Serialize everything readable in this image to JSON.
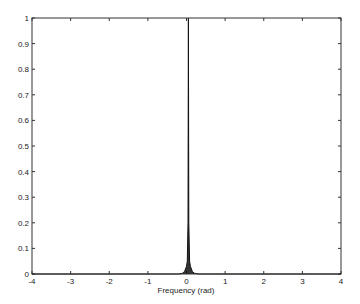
{
  "chart_data": {
    "type": "line",
    "title": "",
    "xlabel": "Frequency (rad)",
    "ylabel": "",
    "xlim": [
      -4,
      4
    ],
    "ylim": [
      0,
      1
    ],
    "grid": false,
    "legend": null,
    "x_ticks": [
      -4,
      -3,
      -2,
      -1,
      0,
      1,
      2,
      3,
      4
    ],
    "y_ticks": [
      0,
      0.1,
      0.2,
      0.3,
      0.4,
      0.5,
      0.6,
      0.7,
      0.8,
      0.9,
      1
    ],
    "x_tick_labels": [
      "-4",
      "-3",
      "-2",
      "-1",
      "0",
      "1",
      "2",
      "3",
      "4"
    ],
    "y_tick_labels": [
      "0",
      "0.1",
      "0.2",
      "0.3",
      "0.4",
      "0.5",
      "0.6",
      "0.7",
      "0.8",
      "0.9",
      "1"
    ],
    "series": [
      {
        "name": "spectrum",
        "color": "#111111",
        "x": [
          -4,
          -0.2,
          -0.1,
          -0.05,
          0.0,
          0.02,
          0.04,
          0.05,
          0.06,
          0.08,
          0.1,
          0.15,
          0.2,
          0.3,
          4
        ],
        "y": [
          0,
          0.0,
          0.003,
          0.01,
          0.03,
          0.05,
          0.2,
          1.0,
          0.2,
          0.05,
          0.03,
          0.01,
          0.003,
          0.0,
          0
        ]
      }
    ],
    "annotations": []
  }
}
